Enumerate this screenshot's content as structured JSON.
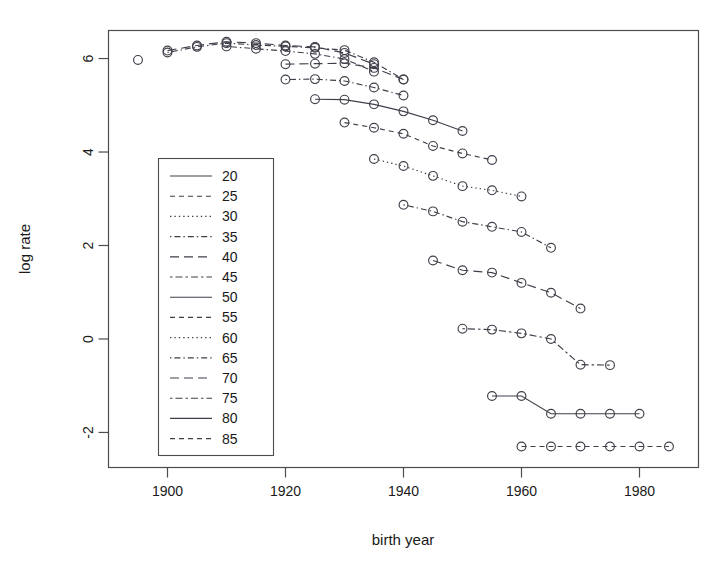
{
  "chart_data": {
    "type": "line",
    "title": "",
    "xlabel": "birth year",
    "ylabel": "log rate",
    "xlim": [
      1890,
      1990
    ],
    "ylim": [
      -2.75,
      6.6
    ],
    "xticks": [
      1900,
      1920,
      1940,
      1960,
      1980
    ],
    "yticks": [
      6,
      4,
      2,
      0,
      -2
    ],
    "grid": false,
    "legend_position": "left-middle",
    "legend_title": "",
    "marker": "open-circle",
    "series": [
      {
        "name": "20",
        "linestyle": "solid",
        "x": [
          1925,
          1930,
          1935,
          1940,
          1945,
          1950
        ],
        "y": [
          5.13,
          5.12,
          5.02,
          4.87,
          4.68,
          4.45
        ]
      },
      {
        "name": "25",
        "linestyle": "dashed",
        "x": [
          1930,
          1935,
          1940,
          1945,
          1950,
          1955
        ],
        "y": [
          4.63,
          4.52,
          4.39,
          4.13,
          3.97,
          3.83
        ]
      },
      {
        "name": "30",
        "linestyle": "dotted",
        "x": [
          1935,
          1940,
          1945,
          1950,
          1955,
          1960
        ],
        "y": [
          3.85,
          3.7,
          3.49,
          3.27,
          3.18,
          3.05
        ]
      },
      {
        "name": "35",
        "linestyle": "dotdash",
        "x": [
          1940,
          1945,
          1950,
          1955,
          1960,
          1965
        ],
        "y": [
          2.87,
          2.73,
          2.51,
          2.4,
          2.29,
          1.95
        ]
      },
      {
        "name": "40",
        "linestyle": "longdash",
        "x": [
          1945,
          1950,
          1955,
          1960,
          1965,
          1970
        ],
        "y": [
          1.68,
          1.47,
          1.42,
          1.2,
          0.99,
          0.65
        ]
      },
      {
        "name": "45",
        "linestyle": "twodash",
        "x": [
          1950,
          1955,
          1960,
          1965,
          1970,
          1975
        ],
        "y": [
          0.22,
          0.2,
          0.12,
          0.0,
          -0.55,
          -0.56
        ]
      },
      {
        "name": "50",
        "linestyle": "solid",
        "x": [
          1955,
          1960,
          1965,
          1970,
          1975,
          1980
        ],
        "y": [
          -1.22,
          -1.22,
          -1.6,
          -1.6,
          -1.6,
          -1.6
        ]
      },
      {
        "name": "55",
        "linestyle": "dashed",
        "x": [
          1960,
          1965,
          1970,
          1975,
          1980,
          1985
        ],
        "y": [
          -2.3,
          -2.3,
          -2.3,
          -2.3,
          -2.3,
          -2.3
        ]
      },
      {
        "name": "60",
        "linestyle": "dotted",
        "x": [
          1895
        ],
        "y": [
          5.97
        ]
      },
      {
        "name": "65",
        "linestyle": "dotdash",
        "x": [
          1900,
          1905,
          1910,
          1915,
          1920,
          1925,
          1930,
          1935,
          1940
        ],
        "y": [
          6.13,
          6.25,
          6.33,
          6.29,
          6.26,
          6.23,
          6.18,
          5.92,
          5.55
        ]
      },
      {
        "name": "70",
        "linestyle": "longdash",
        "x": [
          1900,
          1905,
          1910,
          1915,
          1920,
          1925,
          1930,
          1935
        ],
        "y": [
          6.17,
          6.28,
          6.36,
          6.33,
          6.28,
          6.25,
          6.12,
          5.88
        ]
      },
      {
        "name": "75",
        "linestyle": "dotdash",
        "x": [
          1910,
          1915,
          1920,
          1925,
          1930,
          1935
        ],
        "y": [
          6.26,
          6.21,
          6.16,
          6.1,
          5.99,
          5.72
        ]
      },
      {
        "name": "80",
        "linestyle": "longdash",
        "x": [
          1920,
          1925,
          1930,
          1935,
          1940
        ],
        "y": [
          5.88,
          5.89,
          5.9,
          5.8,
          5.55
        ]
      },
      {
        "name": "85",
        "linestyle": "dotdash",
        "x": [
          1920,
          1925,
          1930,
          1935,
          1940
        ],
        "y": [
          5.55,
          5.56,
          5.52,
          5.38,
          5.21
        ]
      }
    ]
  },
  "legend": {
    "entries": [
      {
        "label": "20",
        "style": "solid"
      },
      {
        "label": "25",
        "style": "dashed"
      },
      {
        "label": "30",
        "style": "dotted"
      },
      {
        "label": "35",
        "style": "dotdash"
      },
      {
        "label": "40",
        "style": "longdash"
      },
      {
        "label": "45",
        "style": "twodash"
      },
      {
        "label": "50",
        "style": "solid"
      },
      {
        "label": "55",
        "style": "dashed"
      },
      {
        "label": "60",
        "style": "dotted"
      },
      {
        "label": "65",
        "style": "dotdash"
      },
      {
        "label": "70",
        "style": "longdash"
      },
      {
        "label": "75",
        "style": "twodash"
      },
      {
        "label": "80",
        "style": "solid"
      },
      {
        "label": "85",
        "style": "dashed"
      }
    ]
  },
  "axes": {
    "x_tick_labels": [
      "1900",
      "1920",
      "1940",
      "1960",
      "1980"
    ],
    "y_tick_labels": [
      "6",
      "4",
      "2",
      "0",
      "-2"
    ],
    "x_axis_title": "birth year",
    "y_axis_title": "log rate"
  },
  "colors": {
    "line": "#3f3f4a",
    "frame": "#4d4d4d",
    "text": "#1a1a1a",
    "background": "#ffffff"
  }
}
